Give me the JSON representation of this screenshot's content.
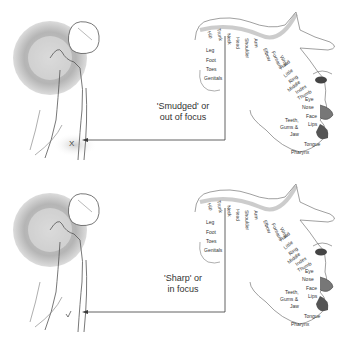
{
  "panels": [
    {
      "id": "top",
      "caption_line1": "'Smudged' or",
      "caption_line2": "out of focus",
      "marker": "X"
    },
    {
      "id": "bottom",
      "caption_line1": "'Sharp' or",
      "caption_line2": "in focus",
      "marker": ""
    }
  ],
  "homunculus_labels": {
    "leg_group": [
      "Leg",
      "Foot",
      "Toes",
      "Genitals"
    ],
    "top_row": [
      "Hip",
      "Trunk",
      "Neck",
      "Head",
      "Shoulder",
      "Arm"
    ],
    "arm_row": [
      "Elbow",
      "Forearm",
      "Wrist"
    ],
    "hand_row": [
      "Hand",
      "Little",
      "Ring",
      "Middle",
      "Index",
      "Thumb"
    ],
    "face_row": [
      "Eye",
      "Nose",
      "Face",
      "Lips"
    ],
    "mouth_row": [
      "Teeth,",
      "Gums &",
      "Jaw"
    ],
    "throat_row": [
      "Tongue",
      "Pharynx"
    ]
  },
  "colors": {
    "line": "#3a3a3a",
    "shading": "#9a9a9a",
    "sketch": "#555555"
  }
}
